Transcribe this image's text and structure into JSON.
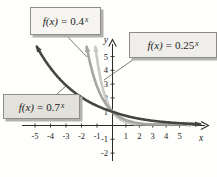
{
  "figure": {
    "background": "#fefefc",
    "axis_color": "#2b2b29",
    "leader_color": "#5c5b58"
  },
  "chart_data": {
    "type": "line",
    "title": "",
    "xlabel": "x",
    "ylabel": "y",
    "xlim": [
      -5.9,
      6.8
    ],
    "ylim": [
      -2.4,
      5.9
    ],
    "x_ticks": [
      -5,
      -4,
      -3,
      -2,
      -1,
      1,
      2,
      3,
      4,
      5
    ],
    "y_ticks": [
      1,
      2,
      3,
      4,
      5,
      -1,
      -2
    ],
    "grid": false,
    "legend_position": "callout-boxes-with-leader-lines",
    "series": [
      {
        "name": "f(x) = 0.25^x",
        "function": "y = 0.25^x",
        "base": 0.25,
        "y_intercept": 1,
        "color": "#c9c8c4",
        "arrowheads": [
          "upper-left",
          "right"
        ]
      },
      {
        "name": "f(x) = 0.4^x",
        "function": "y = 0.4^x",
        "base": 0.4,
        "y_intercept": 1,
        "color": "#a6a5a1",
        "arrowheads": [
          "upper-left",
          "right"
        ]
      },
      {
        "name": "f(x) = 0.7^x",
        "function": "y = 0.7^x",
        "base": 0.7,
        "y_intercept": 1,
        "color": "#454543",
        "arrowheads": [
          "upper-left",
          "right"
        ]
      }
    ]
  },
  "callouts": [
    {
      "fx": "f(x)",
      "eq": "=",
      "base": "0.4",
      "sup": "x"
    },
    {
      "fx": "f(x)",
      "eq": "=",
      "base": "0.25",
      "sup": "x"
    },
    {
      "fx": "f(x)",
      "eq": "=",
      "base": "0.7",
      "sup": "x"
    }
  ]
}
